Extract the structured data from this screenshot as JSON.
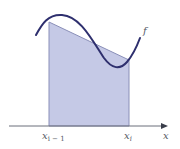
{
  "diagram": {
    "labels": {
      "curve": "f",
      "left_base": "x",
      "left_sub": "i − 1",
      "right_base": "x",
      "right_sub": "i",
      "axis": "x"
    },
    "colors": {
      "curve": "#2e2f6e",
      "fill": "#c5c9e6",
      "fill_edge": "#8a8fb8",
      "axis": "#6b6f7a"
    }
  }
}
